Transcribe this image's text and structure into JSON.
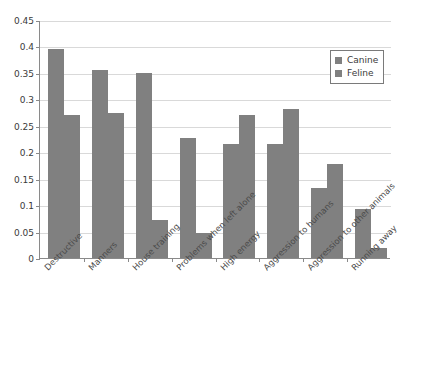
{
  "chart_data": {
    "type": "bar",
    "title": "",
    "subtitle": "",
    "xlabel": "",
    "ylabel": "",
    "ylim": [
      0,
      0.45
    ],
    "yticks": [
      "0",
      "0.05",
      "0.1",
      "0.15",
      "0.2",
      "0.25",
      "0.3",
      "0.35",
      "0.4",
      "0.45"
    ],
    "ytick_values": [
      0,
      0.05,
      0.1,
      0.15,
      0.2,
      0.25,
      0.3,
      0.35,
      0.4,
      0.45
    ],
    "grid": true,
    "legend_position": "top-right",
    "categories": [
      "Destructive",
      "Manners",
      "House training",
      "Problems when left alone",
      "High energy",
      "Aggression to humans",
      "Aggression to other animals",
      "Running away"
    ],
    "series": [
      {
        "name": "Canine",
        "color": "#808080",
        "values": [
          0.395,
          0.355,
          0.35,
          0.227,
          0.215,
          0.215,
          0.133,
          0.093
        ]
      },
      {
        "name": "Feline",
        "color": "#808080",
        "values": [
          0.27,
          0.275,
          0.072,
          0.047,
          0.27,
          0.282,
          0.178,
          0.018
        ]
      }
    ]
  },
  "legend": {
    "items": [
      {
        "label": "Canine",
        "swatch_color": "#808080"
      },
      {
        "label": "Feline",
        "swatch_color": "#808080"
      }
    ]
  },
  "axis": {
    "line_color": "#8a8a8a",
    "grid_color": "#d9d9d9"
  }
}
